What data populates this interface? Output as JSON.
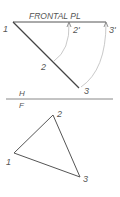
{
  "top_view": {
    "plane_label": "FRONTAL PL",
    "points": {
      "p1": "1",
      "p2": "2",
      "p3": "3",
      "p2_prime": "2'",
      "p3_prime": "3'"
    }
  },
  "fold_line": {
    "upper": "H",
    "lower": "F"
  },
  "front_view": {
    "points": {
      "p1": "1",
      "p2": "2",
      "p3": "3"
    }
  },
  "colors": {
    "line": "#555555",
    "arc": "#b0b0b0",
    "text": "#555555"
  }
}
